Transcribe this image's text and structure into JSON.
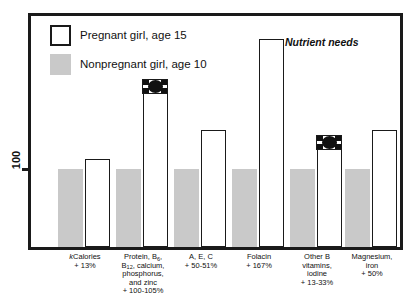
{
  "chart_data": {
    "type": "bar",
    "title": "",
    "annotation": "Nutrient needs",
    "xlabel": "",
    "ylabel": "100",
    "ytick_labels": [
      "100"
    ],
    "ylim": [
      0,
      290
    ],
    "grid": false,
    "legend_position": "top-left",
    "baseline_value": 100,
    "categories": [
      "kCalories",
      "Protein, B6, B12, calcium, phosphorus, and zinc",
      "A, E, C",
      "Folacin",
      "Other B vitamins, iodine",
      "Magnesium, iron"
    ],
    "series": [
      {
        "name": "Nonpregnant girl, age 10",
        "color": "#c9c9c9",
        "values": [
          100,
          100,
          100,
          100,
          100,
          100
        ]
      },
      {
        "name": "Pregnant girl, age 15",
        "color": "#ffffff",
        "values": [
          113,
          205,
          150,
          267,
          133,
          150
        ]
      }
    ],
    "increase_labels": [
      "+ 13%",
      "+ 100-105%",
      "+ 50-51%",
      "+ 167%",
      "+ 13-33%",
      "+ 50%"
    ]
  },
  "legend": {
    "items": [
      {
        "label": "Pregnant girl, age 15",
        "swatch": "open"
      },
      {
        "label": "Nonpregnant girl, age 10",
        "swatch": "filled"
      }
    ]
  },
  "axis": {
    "y_label": "100"
  },
  "annotation": {
    "text": "Nutrient needs"
  },
  "xlabels": [
    {
      "name_html": "<i>k</i>Calories",
      "percent": "+ 13%"
    },
    {
      "name_html": "Protein, B<sub>6</sub>,<br>B<sub>12</sub>, calcium,<br>phosphorus,<br>and zinc",
      "percent": "+ 100-105%"
    },
    {
      "name_html": "A, E, C",
      "percent": "+ 50-51%"
    },
    {
      "name_html": "Folacin",
      "percent": "+ 167%"
    },
    {
      "name_html": "Other B<br>vitamins,<br>iodine",
      "percent": "+ 13-33%"
    },
    {
      "name_html": "Magnesium,<br>iron",
      "percent": "+ 50%"
    }
  ]
}
